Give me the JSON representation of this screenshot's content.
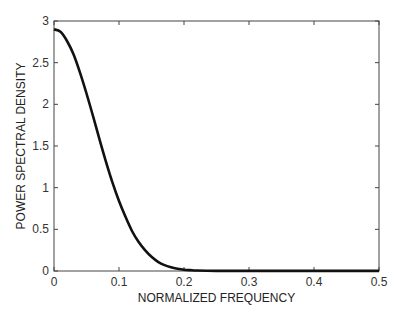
{
  "chart_data": {
    "type": "line",
    "title": "",
    "xlabel": "NORMALIZED FREQUENCY",
    "ylabel": "POWER SPECTRAL DENSITY",
    "xlim": [
      0,
      0.5
    ],
    "ylim": [
      0,
      3
    ],
    "xticks": [
      0,
      0.1,
      0.2,
      0.3,
      0.4,
      0.5
    ],
    "xtick_labels": [
      "0",
      "0.1",
      "0.2",
      "0.3",
      "0.4",
      "0.5"
    ],
    "yticks": [
      0,
      0.5,
      1,
      1.5,
      2,
      2.5,
      3
    ],
    "ytick_labels": [
      "0",
      "0.5",
      "1",
      "1.5",
      "2",
      "2.5",
      "3"
    ],
    "grid": false,
    "legend": null,
    "series": [
      {
        "name": "PSD",
        "color": "#111111",
        "x": [
          0,
          0.01,
          0.02,
          0.03,
          0.04,
          0.05,
          0.06,
          0.07,
          0.08,
          0.09,
          0.1,
          0.11,
          0.12,
          0.13,
          0.14,
          0.15,
          0.16,
          0.17,
          0.18,
          0.19,
          0.2,
          0.21,
          0.22,
          0.25,
          0.3,
          0.35,
          0.4,
          0.45,
          0.5
        ],
        "values": [
          2.9,
          2.87,
          2.76,
          2.6,
          2.38,
          2.13,
          1.86,
          1.58,
          1.31,
          1.06,
          0.84,
          0.65,
          0.48,
          0.35,
          0.25,
          0.17,
          0.11,
          0.07,
          0.045,
          0.028,
          0.016,
          0.01,
          0.006,
          0.002,
          0.001,
          0.001,
          0.001,
          0.001,
          0.001
        ]
      }
    ]
  }
}
